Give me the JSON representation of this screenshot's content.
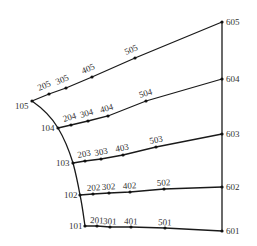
{
  "diagram": {
    "type": "mesh-grid",
    "width": 257,
    "height": 246,
    "colors": {
      "line": "#1a1a1a",
      "node": "#111111",
      "label": "#333333",
      "background": "#ffffff"
    },
    "rows": [
      {
        "id": "row-1",
        "nodes": [
          {
            "id": "101",
            "x": 85,
            "y": 226,
            "lx": -16,
            "ly": 3,
            "anchor": "end-left"
          },
          {
            "id": "201",
            "x": 97,
            "y": 226,
            "lx": -7,
            "ly": -3
          },
          {
            "id": "301",
            "x": 110,
            "y": 227,
            "lx": -7,
            "ly": -3
          },
          {
            "id": "401",
            "x": 131,
            "y": 227,
            "lx": -7,
            "ly": -3
          },
          {
            "id": "501",
            "x": 165,
            "y": 228,
            "lx": -7,
            "ly": -3
          },
          {
            "id": "601",
            "x": 222,
            "y": 231,
            "lx": 4,
            "ly": 3
          }
        ]
      },
      {
        "id": "row-2",
        "nodes": [
          {
            "id": "102",
            "x": 80,
            "y": 195,
            "lx": -16,
            "ly": 3
          },
          {
            "id": "202",
            "x": 93,
            "y": 194,
            "lx": -6,
            "ly": -3
          },
          {
            "id": "302",
            "x": 109,
            "y": 193,
            "lx": -7,
            "ly": -3
          },
          {
            "id": "402",
            "x": 130,
            "y": 192,
            "lx": -7,
            "ly": -3
          },
          {
            "id": "502",
            "x": 164,
            "y": 189,
            "lx": -7,
            "ly": -3
          },
          {
            "id": "602",
            "x": 222,
            "y": 187,
            "lx": 4,
            "ly": 3
          }
        ]
      },
      {
        "id": "row-3",
        "nodes": [
          {
            "id": "103",
            "x": 73,
            "y": 163,
            "lx": -17,
            "ly": 3
          },
          {
            "id": "203",
            "x": 85,
            "y": 161,
            "lx": -7,
            "ly": -3
          },
          {
            "id": "303",
            "x": 101,
            "y": 159,
            "lx": -6,
            "ly": -3
          },
          {
            "id": "403",
            "x": 123,
            "y": 155,
            "lx": -7,
            "ly": -3
          },
          {
            "id": "503",
            "x": 156,
            "y": 147,
            "lx": -6,
            "ly": -3
          },
          {
            "id": "603",
            "x": 222,
            "y": 134,
            "lx": 4,
            "ly": 3
          }
        ]
      },
      {
        "id": "row-4",
        "nodes": [
          {
            "id": "104",
            "x": 58,
            "y": 128,
            "lx": -17,
            "ly": 3
          },
          {
            "id": "204",
            "x": 71,
            "y": 125,
            "lx": -7,
            "ly": -3
          },
          {
            "id": "304",
            "x": 88,
            "y": 121,
            "lx": -7,
            "ly": -3
          },
          {
            "id": "404",
            "x": 108,
            "y": 116,
            "lx": -7,
            "ly": -3
          },
          {
            "id": "504",
            "x": 146,
            "y": 101,
            "lx": -6,
            "ly": -3
          },
          {
            "id": "604",
            "x": 222,
            "y": 79,
            "lx": 4,
            "ly": 3
          }
        ]
      },
      {
        "id": "row-5",
        "nodes": [
          {
            "id": "105",
            "x": 32,
            "y": 101,
            "lx": -17,
            "ly": 8
          },
          {
            "id": "205",
            "x": 49,
            "y": 94,
            "lx": -10,
            "ly": -3
          },
          {
            "id": "305",
            "x": 66,
            "y": 88,
            "lx": -9,
            "ly": -3
          },
          {
            "id": "405",
            "x": 92,
            "y": 77,
            "lx": -9,
            "ly": -3
          },
          {
            "id": "505",
            "x": 135,
            "y": 58,
            "lx": -9,
            "ly": -3
          },
          {
            "id": "605",
            "x": 222,
            "y": 22,
            "lx": 4,
            "ly": 3
          }
        ]
      }
    ],
    "left_boundary": {
      "id": "curved-edge",
      "path": "M85,226 C83,212 82,204 80,195 C78,184 76,174 73,163 C69,150 64,138 58,128 C51,116 42,108 32,101"
    },
    "right_boundary": {
      "id": "vertical-edge",
      "nodes": [
        "601",
        "602",
        "603",
        "604",
        "605"
      ]
    }
  }
}
